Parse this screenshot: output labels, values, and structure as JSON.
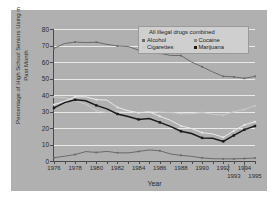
{
  "chart_data": {
    "type": "line",
    "title": "",
    "xlabel": "Year",
    "ylabel": "Percentage of High School Seniors Using in Past Month",
    "ylim": [
      0,
      80
    ],
    "xlim": [
      1976,
      1995
    ],
    "yticks": [
      0,
      10,
      20,
      30,
      40,
      50,
      60,
      70,
      80
    ],
    "grid": true,
    "legend_position": "top-right",
    "legend_title": "All illegal drugs combined",
    "x": [
      1976,
      1977,
      1978,
      1979,
      1980,
      1981,
      1982,
      1983,
      1984,
      1985,
      1986,
      1987,
      1988,
      1989,
      1990,
      1991,
      1992,
      1993,
      1994,
      1995
    ],
    "xtick_labels_row1": [
      "1976",
      "1978",
      "1980",
      "1982",
      "1984",
      "1986",
      "1988",
      "1990",
      "1992",
      "1994"
    ],
    "xtick_labels_row2": [
      "1993",
      "1995"
    ],
    "series": [
      {
        "name": "Alcohol",
        "color": "#6a6a6a",
        "marker": "square",
        "values": [
          68.3,
          71.2,
          72.1,
          71.8,
          72.0,
          70.7,
          69.7,
          69.4,
          67.2,
          65.9,
          65.3,
          64.0,
          63.9,
          60.0,
          57.1,
          54.0,
          51.3,
          51.0,
          50.1,
          51.3
        ]
      },
      {
        "name": "Cigarettes",
        "color": "#c9c9c9",
        "marker": "square",
        "values": [
          38.8,
          38.4,
          36.7,
          34.4,
          30.5,
          29.4,
          30.0,
          30.3,
          29.3,
          30.1,
          29.6,
          29.4,
          28.7,
          28.6,
          29.4,
          28.3,
          27.8,
          29.9,
          31.2,
          33.5
        ]
      },
      {
        "name": "All illegal drugs combined",
        "color": "#e8e8e8",
        "marker": "square",
        "values": [
          34.2,
          36.2,
          38.9,
          38.9,
          37.2,
          36.9,
          32.5,
          30.5,
          29.2,
          29.7,
          27.1,
          24.7,
          21.3,
          19.7,
          17.2,
          16.4,
          14.4,
          18.3,
          21.9,
          23.8
        ]
      },
      {
        "name": "Marijuana",
        "color": "#1a1a1a",
        "marker": "square",
        "values": [
          32.2,
          35.4,
          37.1,
          36.5,
          33.7,
          31.6,
          28.5,
          27.0,
          25.2,
          25.7,
          23.4,
          21.0,
          18.0,
          16.7,
          14.0,
          13.8,
          11.9,
          15.5,
          19.0,
          21.2
        ]
      },
      {
        "name": "Cocaine",
        "color": "#6a6a6a",
        "marker": "square",
        "values": [
          2.0,
          2.9,
          3.9,
          5.7,
          5.2,
          5.8,
          5.0,
          4.9,
          5.8,
          6.7,
          6.2,
          4.3,
          3.4,
          2.8,
          1.9,
          1.4,
          1.3,
          1.3,
          1.5,
          1.8
        ]
      }
    ],
    "legend_entries": [
      {
        "label": "All illegal drugs combined",
        "color": "#e8e8e8",
        "row": 0,
        "col": 0
      },
      {
        "label": "Alcohol",
        "color": "#6a6a6a",
        "row": 1,
        "col": 0
      },
      {
        "label": "Cocaine",
        "color": "#6a6a6a",
        "row": 1,
        "col": 1
      },
      {
        "label": "Cigarettes",
        "color": "#c9c9c9",
        "row": 2,
        "col": 0
      },
      {
        "label": "Marijuana",
        "color": "#1a1a1a",
        "row": 2,
        "col": 1
      }
    ]
  },
  "colors": {
    "panel_background": "#b0b0b0",
    "figure_background": "#ffffff",
    "gridline": "#eaeaea",
    "axis": "#4a4a4a",
    "legend_background": "#cfcfcf",
    "legend_border": "#9a9a9a",
    "tick_text": "#2b2b2b"
  }
}
